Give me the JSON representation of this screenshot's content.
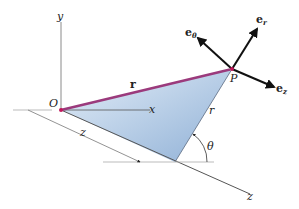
{
  "diagram": {
    "type": "cylindrical-coordinates",
    "colors": {
      "position_vector": "#9b3a7c",
      "shaded_plane": "#b9cfe6",
      "shaded_plane_dark": "#8fb0d6",
      "axis": "#8a8a8a",
      "unit_vectors": "#111111",
      "point": "#c2185b"
    },
    "axes": {
      "y_label": "y",
      "x_label": "x",
      "z_label": "z"
    },
    "points": {
      "origin_label": "O",
      "point_label": "P"
    },
    "vectors": {
      "position_label": "r"
    },
    "dimensions": {
      "z_label": "z",
      "r_label": "r",
      "theta_label": "θ"
    },
    "unit_vectors": {
      "e_theta": {
        "base": "e",
        "sub": "θ"
      },
      "e_r": {
        "base": "e",
        "sub": "r"
      },
      "e_z": {
        "base": "e",
        "sub": "z"
      }
    }
  }
}
